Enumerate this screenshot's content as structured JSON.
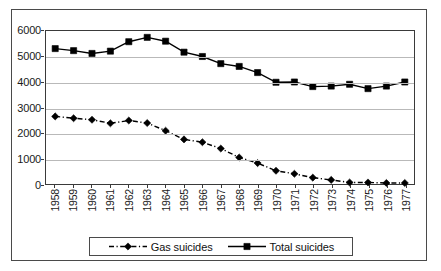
{
  "chart_data": {
    "type": "line",
    "title": "",
    "subtitle": "",
    "xlabel": "",
    "ylabel": "",
    "ylim": [
      0,
      6000
    ],
    "y_ticks": [
      0,
      1000,
      2000,
      3000,
      4000,
      5000,
      6000
    ],
    "y_tick_labels": [
      "0",
      "1000",
      "2000",
      "3000",
      "4000",
      "5000",
      "6000"
    ],
    "grid": true,
    "legend_position": "bottom",
    "categories": [
      "1958",
      "1959",
      "1960",
      "1961",
      "1962",
      "1963",
      "1964",
      "1965",
      "1966",
      "1967",
      "1968",
      "1969",
      "1970",
      "1971",
      "1972",
      "1973",
      "1974",
      "1975",
      "1976",
      "1977"
    ],
    "series": [
      {
        "name": "Gas suicides",
        "marker": "diamond",
        "line_style": "dash-dot",
        "color": "#000000",
        "values": [
          2650,
          2580,
          2520,
          2380,
          2490,
          2390,
          2090,
          1750,
          1640,
          1390,
          1040,
          820,
          520,
          400,
          250,
          160,
          60,
          60,
          40,
          40
        ]
      },
      {
        "name": "Total suicides",
        "marker": "square",
        "line_style": "solid",
        "color": "#000000",
        "values": [
          5310,
          5230,
          5120,
          5210,
          5580,
          5750,
          5600,
          5170,
          5000,
          4720,
          4610,
          4370,
          3990,
          4000,
          3820,
          3840,
          3910,
          3740,
          3840,
          4000
        ]
      }
    ]
  },
  "legend": {
    "entries": [
      {
        "label": "Gas suicides"
      },
      {
        "label": "Total suicides"
      }
    ]
  }
}
